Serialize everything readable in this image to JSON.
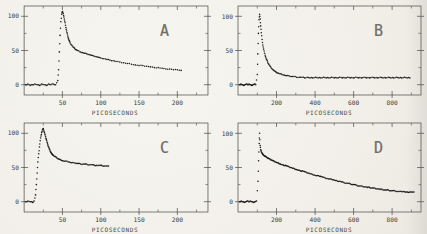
{
  "figure": {
    "description_labels": [
      "A",
      "B",
      "C",
      "D"
    ],
    "background_color": "#f1efe8"
  },
  "style": {
    "dot_color": "#1d1c1a",
    "frame_color": "#4a4943",
    "tick_label_color": "#3d3c37",
    "letter_color": "#6e6c66"
  },
  "chart_data": [
    {
      "type": "scatter",
      "label": "A",
      "xlabel": "PICOSECONDS",
      "ylabel": "",
      "xlim": [
        0,
        240
      ],
      "ylim": [
        -15,
        115
      ],
      "xticks": [
        50,
        100,
        150,
        200
      ],
      "xminor": [
        25,
        75,
        125,
        175,
        225
      ],
      "yticks": [
        0,
        50,
        100
      ],
      "yminor": [
        25,
        75
      ],
      "points": [
        [
          2,
          0
        ],
        [
          5,
          1
        ],
        [
          8,
          -1
        ],
        [
          11,
          0
        ],
        [
          14,
          1
        ],
        [
          17,
          0
        ],
        [
          20,
          -1
        ],
        [
          23,
          1
        ],
        [
          26,
          0
        ],
        [
          29,
          -1
        ],
        [
          32,
          1
        ],
        [
          35,
          0
        ],
        [
          38,
          1
        ],
        [
          41,
          0
        ],
        [
          44,
          6
        ],
        [
          45,
          22
        ],
        [
          46,
          48
        ],
        [
          47,
          72
        ],
        [
          48,
          92
        ],
        [
          49,
          103
        ],
        [
          50,
          107
        ],
        [
          51,
          104
        ],
        [
          52,
          99
        ],
        [
          53,
          93
        ],
        [
          54,
          87
        ],
        [
          55,
          81
        ],
        [
          56,
          76
        ],
        [
          57,
          71
        ],
        [
          58,
          67
        ],
        [
          59,
          64
        ],
        [
          60,
          61
        ],
        [
          62,
          58
        ],
        [
          64,
          55
        ],
        [
          66,
          53
        ],
        [
          68,
          51
        ],
        [
          70,
          50
        ],
        [
          73,
          48
        ],
        [
          76,
          47
        ],
        [
          79,
          46
        ],
        [
          82,
          45
        ],
        [
          85,
          44
        ],
        [
          88,
          43
        ],
        [
          91,
          42
        ],
        [
          94,
          41
        ],
        [
          97,
          40
        ],
        [
          100,
          39
        ],
        [
          104,
          38
        ],
        [
          108,
          37
        ],
        [
          112,
          36
        ],
        [
          116,
          35
        ],
        [
          120,
          34
        ],
        [
          125,
          33
        ],
        [
          130,
          32
        ],
        [
          135,
          31
        ],
        [
          140,
          30
        ],
        [
          145,
          29
        ],
        [
          150,
          28
        ],
        [
          155,
          28
        ],
        [
          160,
          27
        ],
        [
          165,
          26
        ],
        [
          170,
          25
        ],
        [
          175,
          25
        ],
        [
          180,
          24
        ],
        [
          185,
          23
        ],
        [
          190,
          23
        ],
        [
          195,
          22
        ],
        [
          200,
          22
        ],
        [
          205,
          21
        ]
      ]
    },
    {
      "type": "scatter",
      "label": "B",
      "xlabel": "PICOSECONDS",
      "ylabel": "",
      "xlim": [
        0,
        950
      ],
      "ylim": [
        -15,
        115
      ],
      "xticks": [
        200,
        400,
        600,
        800
      ],
      "xminor": [
        100,
        300,
        500,
        700,
        900
      ],
      "yticks": [
        0,
        50,
        100
      ],
      "yminor": [
        25,
        75
      ],
      "points": [
        [
          8,
          0
        ],
        [
          15,
          1
        ],
        [
          22,
          0
        ],
        [
          29,
          -1
        ],
        [
          36,
          0
        ],
        [
          43,
          1
        ],
        [
          50,
          0
        ],
        [
          57,
          1
        ],
        [
          64,
          0
        ],
        [
          71,
          -1
        ],
        [
          78,
          0
        ],
        [
          85,
          1
        ],
        [
          92,
          0
        ],
        [
          100,
          15
        ],
        [
          103,
          45
        ],
        [
          106,
          75
        ],
        [
          109,
          95
        ],
        [
          112,
          103
        ],
        [
          115,
          96
        ],
        [
          118,
          86
        ],
        [
          121,
          76
        ],
        [
          125,
          66
        ],
        [
          129,
          58
        ],
        [
          133,
          52
        ],
        [
          138,
          46
        ],
        [
          143,
          41
        ],
        [
          148,
          37
        ],
        [
          154,
          33
        ],
        [
          160,
          30
        ],
        [
          167,
          27
        ],
        [
          174,
          24
        ],
        [
          182,
          22
        ],
        [
          190,
          20
        ],
        [
          199,
          18
        ],
        [
          208,
          17
        ],
        [
          218,
          16
        ],
        [
          228,
          15
        ],
        [
          240,
          14
        ],
        [
          252,
          13
        ],
        [
          264,
          13
        ],
        [
          276,
          12
        ],
        [
          290,
          12
        ],
        [
          304,
          11
        ],
        [
          318,
          11
        ],
        [
          332,
          11
        ],
        [
          346,
          10
        ],
        [
          360,
          11
        ],
        [
          374,
          10
        ],
        [
          388,
          10
        ],
        [
          402,
          11
        ],
        [
          416,
          10
        ],
        [
          430,
          10
        ],
        [
          444,
          11
        ],
        [
          458,
          10
        ],
        [
          472,
          10
        ],
        [
          486,
          11
        ],
        [
          500,
          10
        ],
        [
          514,
          10
        ],
        [
          528,
          11
        ],
        [
          542,
          10
        ],
        [
          556,
          10
        ],
        [
          570,
          11
        ],
        [
          584,
          10
        ],
        [
          598,
          10
        ],
        [
          612,
          11
        ],
        [
          626,
          10
        ],
        [
          640,
          10
        ],
        [
          654,
          11
        ],
        [
          668,
          10
        ],
        [
          682,
          10
        ],
        [
          696,
          11
        ],
        [
          710,
          10
        ],
        [
          724,
          10
        ],
        [
          738,
          11
        ],
        [
          752,
          10
        ],
        [
          766,
          10
        ],
        [
          780,
          11
        ],
        [
          794,
          10
        ],
        [
          808,
          10
        ],
        [
          822,
          11
        ],
        [
          836,
          10
        ],
        [
          850,
          10
        ],
        [
          864,
          11
        ],
        [
          878,
          10
        ],
        [
          892,
          10
        ]
      ]
    },
    {
      "type": "scatter",
      "label": "C",
      "xlabel": "PICOSECONDS",
      "ylabel": "",
      "xlim": [
        0,
        240
      ],
      "ylim": [
        -15,
        115
      ],
      "xticks": [
        50,
        100,
        150,
        200
      ],
      "xminor": [
        25,
        75,
        125,
        175,
        225
      ],
      "yticks": [
        0,
        50,
        100
      ],
      "yminor": [
        25,
        75
      ],
      "points": [
        [
          2,
          0
        ],
        [
          5,
          1
        ],
        [
          8,
          0
        ],
        [
          11,
          -1
        ],
        [
          13,
          1
        ],
        [
          15,
          10
        ],
        [
          16,
          25
        ],
        [
          17,
          42
        ],
        [
          18,
          58
        ],
        [
          19,
          70
        ],
        [
          20,
          80
        ],
        [
          21,
          89
        ],
        [
          22,
          96
        ],
        [
          23,
          101
        ],
        [
          24,
          105
        ],
        [
          25,
          107
        ],
        [
          26,
          103
        ],
        [
          27,
          99
        ],
        [
          28,
          95
        ],
        [
          29,
          91
        ],
        [
          30,
          87
        ],
        [
          31,
          83
        ],
        [
          32,
          80
        ],
        [
          33,
          77
        ],
        [
          34,
          74
        ],
        [
          35,
          72
        ],
        [
          36,
          70
        ],
        [
          37,
          69
        ],
        [
          38,
          68
        ],
        [
          40,
          66
        ],
        [
          42,
          65
        ],
        [
          44,
          63
        ],
        [
          46,
          62
        ],
        [
          48,
          61
        ],
        [
          50,
          60
        ],
        [
          53,
          59
        ],
        [
          56,
          59
        ],
        [
          59,
          58
        ],
        [
          62,
          57
        ],
        [
          65,
          57
        ],
        [
          68,
          56
        ],
        [
          71,
          56
        ],
        [
          74,
          55
        ],
        [
          77,
          55
        ],
        [
          80,
          55
        ],
        [
          83,
          54
        ],
        [
          86,
          54
        ],
        [
          89,
          54
        ],
        [
          92,
          53
        ],
        [
          95,
          53
        ],
        [
          98,
          53
        ],
        [
          101,
          53
        ],
        [
          104,
          52
        ],
        [
          107,
          52
        ],
        [
          110,
          52
        ]
      ]
    },
    {
      "type": "scatter",
      "label": "D",
      "xlabel": "PICOSECONDS",
      "ylabel": "",
      "xlim": [
        0,
        950
      ],
      "ylim": [
        -15,
        115
      ],
      "xticks": [
        200,
        400,
        600,
        800
      ],
      "xminor": [
        100,
        300,
        500,
        700,
        900
      ],
      "yticks": [
        0,
        50,
        100
      ],
      "yminor": [
        25,
        75
      ],
      "points": [
        [
          8,
          0
        ],
        [
          16,
          1
        ],
        [
          24,
          0
        ],
        [
          32,
          -1
        ],
        [
          40,
          0
        ],
        [
          48,
          1
        ],
        [
          56,
          0
        ],
        [
          64,
          1
        ],
        [
          72,
          0
        ],
        [
          80,
          -1
        ],
        [
          88,
          0
        ],
        [
          96,
          1
        ],
        [
          104,
          30
        ],
        [
          107,
          60
        ],
        [
          110,
          85
        ],
        [
          112,
          100
        ],
        [
          115,
          82
        ],
        [
          118,
          76
        ],
        [
          121,
          73
        ],
        [
          125,
          71
        ],
        [
          129,
          69
        ],
        [
          133,
          68
        ],
        [
          138,
          67
        ],
        [
          143,
          66
        ],
        [
          148,
          65
        ],
        [
          154,
          64
        ],
        [
          160,
          63
        ],
        [
          167,
          62
        ],
        [
          174,
          61
        ],
        [
          181,
          60
        ],
        [
          188,
          59
        ],
        [
          196,
          58
        ],
        [
          204,
          57
        ],
        [
          212,
          56
        ],
        [
          220,
          55
        ],
        [
          229,
          54
        ],
        [
          238,
          53
        ],
        [
          247,
          53
        ],
        [
          256,
          52
        ],
        [
          265,
          51
        ],
        [
          274,
          50
        ],
        [
          284,
          49
        ],
        [
          294,
          48
        ],
        [
          304,
          47
        ],
        [
          314,
          46
        ],
        [
          324,
          45
        ],
        [
          334,
          45
        ],
        [
          344,
          44
        ],
        [
          354,
          43
        ],
        [
          364,
          42
        ],
        [
          374,
          41
        ],
        [
          385,
          40
        ],
        [
          396,
          39
        ],
        [
          407,
          38
        ],
        [
          418,
          38
        ],
        [
          429,
          37
        ],
        [
          440,
          36
        ],
        [
          451,
          35
        ],
        [
          462,
          34
        ],
        [
          473,
          33
        ],
        [
          484,
          33
        ],
        [
          495,
          32
        ],
        [
          506,
          31
        ],
        [
          517,
          30
        ],
        [
          528,
          30
        ],
        [
          539,
          29
        ],
        [
          550,
          28
        ],
        [
          561,
          27
        ],
        [
          572,
          27
        ],
        [
          583,
          26
        ],
        [
          594,
          25
        ],
        [
          605,
          25
        ],
        [
          616,
          24
        ],
        [
          627,
          23
        ],
        [
          638,
          23
        ],
        [
          649,
          22
        ],
        [
          660,
          22
        ],
        [
          671,
          21
        ],
        [
          682,
          21
        ],
        [
          693,
          20
        ],
        [
          704,
          20
        ],
        [
          715,
          19
        ],
        [
          726,
          19
        ],
        [
          737,
          18
        ],
        [
          748,
          18
        ],
        [
          759,
          17
        ],
        [
          770,
          17
        ],
        [
          781,
          17
        ],
        [
          792,
          16
        ],
        [
          803,
          16
        ],
        [
          814,
          16
        ],
        [
          825,
          15
        ],
        [
          836,
          15
        ],
        [
          847,
          15
        ],
        [
          858,
          15
        ],
        [
          869,
          14
        ],
        [
          880,
          14
        ],
        [
          891,
          14
        ],
        [
          902,
          14
        ],
        [
          913,
          14
        ]
      ]
    }
  ]
}
